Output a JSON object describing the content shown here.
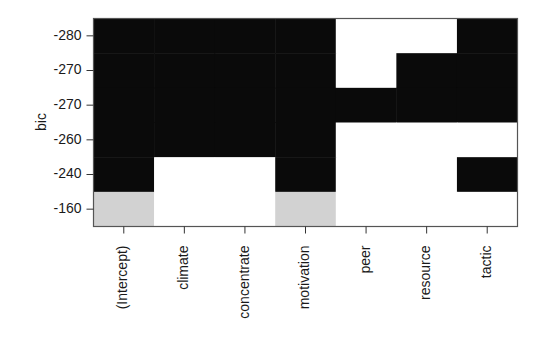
{
  "chart_data": {
    "type": "heatmap",
    "title": "",
    "xlabel": "",
    "ylabel": "bic",
    "columns": [
      "(Intercept)",
      "climate",
      "concentrate",
      "motivation",
      "peer",
      "resource",
      "tactic"
    ],
    "rows": [
      "-280",
      "-270",
      "-270",
      "-260",
      "-240",
      "-160"
    ],
    "matrix": [
      [
        1,
        1,
        1,
        1,
        0,
        0,
        1
      ],
      [
        1,
        1,
        1,
        1,
        0,
        1,
        1
      ],
      [
        1,
        1,
        1,
        1,
        1,
        1,
        1
      ],
      [
        1,
        1,
        1,
        1,
        0,
        0,
        0
      ],
      [
        1,
        0,
        0,
        1,
        0,
        0,
        1
      ],
      [
        2,
        0,
        0,
        2,
        0,
        0,
        0
      ]
    ],
    "legend": {
      "1": "included (black)",
      "0": "excluded (white)",
      "2": "included, lowest model (gray)"
    },
    "colors": {
      "0": "#ffffff",
      "1": "#0a0a0a",
      "2": "#d2d2d2"
    },
    "grid": false
  },
  "axis": {
    "ylabel": "bic"
  }
}
